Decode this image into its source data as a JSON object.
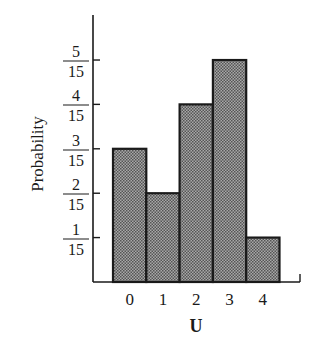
{
  "chart_data": {
    "type": "bar",
    "title": "",
    "xlabel": "U",
    "ylabel": "Probability",
    "categories": [
      "0",
      "1",
      "2",
      "3",
      "4"
    ],
    "values": [
      0.2,
      0.1333,
      0.2667,
      0.3333,
      0.0667
    ],
    "values_fraction": [
      "3/15",
      "2/15",
      "4/15",
      "5/15",
      "1/15"
    ],
    "y_ticks": [
      {
        "value": 0.0667,
        "num": "1",
        "den": "15"
      },
      {
        "value": 0.1333,
        "num": "2",
        "den": "15"
      },
      {
        "value": 0.2,
        "num": "3",
        "den": "15"
      },
      {
        "value": 0.2667,
        "num": "4",
        "den": "15"
      },
      {
        "value": 0.3333,
        "num": "5",
        "den": "15"
      }
    ],
    "ylim": [
      0,
      0.4
    ],
    "grid": false,
    "legend": null,
    "bar_fill": "#8c8c8c",
    "bar_edge": "#1a1a1a"
  }
}
